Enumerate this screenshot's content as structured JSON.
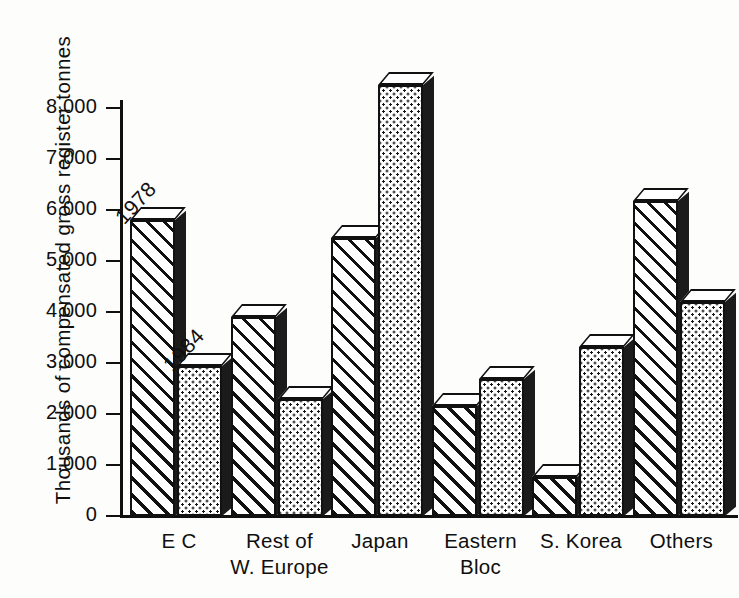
{
  "chart_data": {
    "type": "bar",
    "title": "",
    "subtitle": "",
    "xlabel": "",
    "ylabel": "Thousands of compensated gross register tonnes",
    "categories": [
      "E C",
      "Rest of\nW. Europe",
      "Japan",
      "Eastern\nBloc",
      "S. Korea",
      "Others"
    ],
    "series": [
      {
        "name": "1978",
        "fill": "diagonal-hatch",
        "values": [
          5800,
          3900,
          5450,
          2150,
          760,
          6170
        ]
      },
      {
        "name": "1984",
        "fill": "dot-stipple",
        "values": [
          2950,
          2290,
          8450,
          2680,
          3320,
          4200
        ]
      }
    ],
    "ylim": [
      0,
      8000
    ],
    "ytick_values": [
      0,
      1000,
      2000,
      3000,
      4000,
      5000,
      6000,
      7000,
      8000
    ],
    "ytick_labels": [
      "0",
      "1,000",
      "2,000",
      "3,000",
      "4,000",
      "5,000",
      "6,000",
      "7,000",
      "8,000"
    ],
    "grid": false,
    "legend": "inline-annotation",
    "annotations": [
      {
        "text": "1978",
        "note": "rotated label above first hatched bar"
      },
      {
        "text": "1984",
        "note": "rotated label above first stippled bar"
      }
    ],
    "colors": {
      "ink": "#111111",
      "paper": "#fdfdfb",
      "shadow": "#1b1b1b"
    }
  },
  "axis": {
    "y_title": "Thousands of compensated gross register tonnes"
  }
}
